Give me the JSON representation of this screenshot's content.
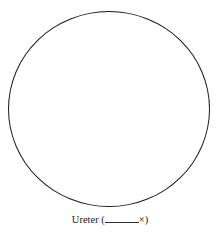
{
  "diagram": {
    "shape": "circle",
    "stroke_color": "#1a1a1a",
    "caption": {
      "label": "Ureter (",
      "blank": "",
      "suffix": "×)"
    }
  }
}
